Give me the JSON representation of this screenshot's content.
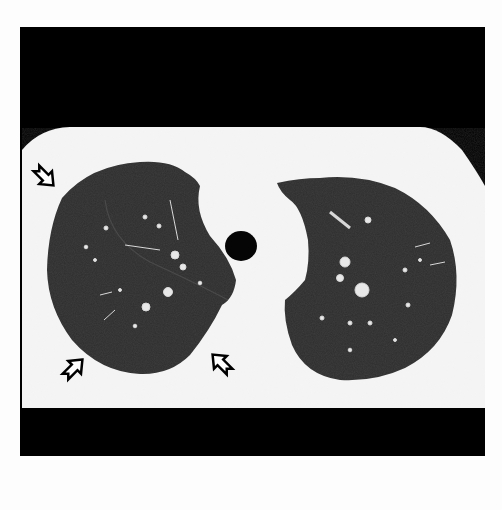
{
  "figure": {
    "type": "axial chest CT, lung window",
    "colors": {
      "background": "#fdfdfd",
      "frame": "#000000",
      "soft_tissue": "#f4f4f4",
      "lung_parenchyma": "#2c2c2c",
      "airway": "#000000",
      "arrow_fill": "#ffffff",
      "arrow_stroke": "#000000"
    },
    "annotations": [
      {
        "type": "arrow",
        "position": "upper-left",
        "points_to": "lateral lung margin"
      },
      {
        "type": "arrow",
        "position": "lower-left",
        "points_to": "posterior lung margin"
      },
      {
        "type": "arrow",
        "position": "lower-center",
        "points_to": "posteromedial lung margin"
      }
    ]
  }
}
